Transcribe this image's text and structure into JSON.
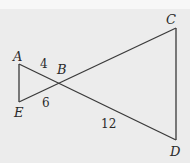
{
  "diagram": {
    "type": "two-triangles-vertical-angles",
    "colors": {
      "background": "#ececec",
      "line": "#3a3a3a",
      "text": "#2a2a2a"
    },
    "points": {
      "A": {
        "label": "A",
        "x": 19,
        "y": 64
      },
      "E": {
        "label": "E",
        "x": 19,
        "y": 102
      },
      "B": {
        "label": "B",
        "x": 59,
        "y": 84
      },
      "C": {
        "label": "C",
        "x": 176,
        "y": 28
      },
      "D": {
        "label": "D",
        "x": 176,
        "y": 140
      }
    },
    "segments": [
      {
        "from": "A",
        "to": "E"
      },
      {
        "from": "A",
        "to": "D"
      },
      {
        "from": "E",
        "to": "C"
      },
      {
        "from": "C",
        "to": "D"
      }
    ],
    "measures": {
      "AB": "4",
      "EB": "6",
      "BD": "12"
    }
  }
}
